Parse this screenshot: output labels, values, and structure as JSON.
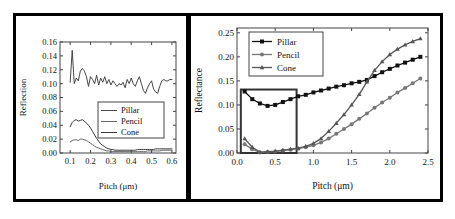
{
  "figure": {
    "left_panel_name": "inset-detail-panel",
    "right_panel_name": "main-plot-panel",
    "connector_name": "zoom-callout-connector"
  },
  "chart_data": [
    {
      "id": "inset",
      "type": "line",
      "title": "",
      "xlabel": "Pitch (μm)",
      "ylabel": "Reflection",
      "xlim": [
        0.05,
        0.62
      ],
      "ylim": [
        0.0,
        0.16
      ],
      "xticks": [
        0.1,
        0.2,
        0.3,
        0.4,
        0.5,
        0.6
      ],
      "xticklabels": [
        "0.1",
        "0.2",
        "0.3",
        "0.4",
        "0.5",
        "0.6"
      ],
      "yticks": [
        0.0,
        0.02,
        0.04,
        0.06,
        0.08,
        0.1,
        0.12,
        0.14,
        0.16
      ],
      "yticklabels": [
        "0.00",
        "0.02",
        "0.04",
        "0.06",
        "0.08",
        "0.10",
        "0.12",
        "0.14",
        "0.16"
      ],
      "grid": false,
      "legend_position": "center-right",
      "legend_entries": [
        "Pillar",
        "Pencil",
        "Cone"
      ],
      "x": [
        0.1,
        0.11,
        0.12,
        0.13,
        0.14,
        0.15,
        0.16,
        0.17,
        0.18,
        0.19,
        0.2,
        0.21,
        0.22,
        0.23,
        0.24,
        0.25,
        0.26,
        0.27,
        0.28,
        0.29,
        0.3,
        0.31,
        0.32,
        0.33,
        0.34,
        0.35,
        0.36,
        0.37,
        0.38,
        0.39,
        0.4,
        0.41,
        0.42,
        0.43,
        0.44,
        0.45,
        0.46,
        0.47,
        0.48,
        0.49,
        0.5,
        0.51,
        0.52,
        0.53,
        0.54,
        0.55,
        0.56,
        0.57,
        0.58,
        0.59,
        0.6
      ],
      "series": [
        {
          "name": "Pillar",
          "color": "#333333",
          "values": [
            0.102,
            0.148,
            0.1,
            0.108,
            0.104,
            0.118,
            0.122,
            0.118,
            0.11,
            0.096,
            0.11,
            0.106,
            0.1,
            0.112,
            0.098,
            0.108,
            0.102,
            0.11,
            0.1,
            0.106,
            0.098,
            0.104,
            0.1,
            0.096,
            0.1,
            0.098,
            0.102,
            0.094,
            0.106,
            0.1,
            0.108,
            0.1,
            0.096,
            0.104,
            0.11,
            0.1,
            0.09,
            0.086,
            0.094,
            0.1,
            0.104,
            0.092,
            0.088,
            0.086,
            0.096,
            0.104,
            0.106,
            0.104,
            0.104,
            0.106,
            0.106
          ]
        },
        {
          "name": "Pencil",
          "color": "#555555",
          "values": [
            0.016,
            0.018,
            0.019,
            0.019,
            0.018,
            0.02,
            0.02,
            0.019,
            0.018,
            0.016,
            0.014,
            0.012,
            0.01,
            0.008,
            0.007,
            0.006,
            0.005,
            0.004,
            0.003,
            0.003,
            0.002,
            0.002,
            0.002,
            0.002,
            0.002,
            0.002,
            0.002,
            0.002,
            0.002,
            0.002,
            0.002,
            0.002,
            0.002,
            0.002,
            0.002,
            0.002,
            0.002,
            0.002,
            0.003,
            0.003,
            0.003,
            0.003,
            0.003,
            0.003,
            0.003,
            0.004,
            0.004,
            0.004,
            0.004,
            0.004,
            0.004
          ]
        },
        {
          "name": "Cone",
          "color": "#222222",
          "values": [
            0.038,
            0.044,
            0.047,
            0.048,
            0.046,
            0.047,
            0.048,
            0.046,
            0.043,
            0.04,
            0.036,
            0.031,
            0.026,
            0.021,
            0.017,
            0.013,
            0.011,
            0.009,
            0.007,
            0.006,
            0.005,
            0.005,
            0.004,
            0.004,
            0.004,
            0.004,
            0.004,
            0.004,
            0.004,
            0.004,
            0.004,
            0.004,
            0.004,
            0.005,
            0.005,
            0.005,
            0.005,
            0.005,
            0.005,
            0.005,
            0.005,
            0.005,
            0.006,
            0.006,
            0.006,
            0.006,
            0.006,
            0.006,
            0.006,
            0.006,
            0.006
          ]
        }
      ]
    },
    {
      "id": "main",
      "type": "line",
      "title": "",
      "xlabel": "Pitch (μm)",
      "ylabel": "Reflectance",
      "xlim": [
        0.0,
        2.5
      ],
      "ylim": [
        0.0,
        0.26
      ],
      "xticks": [
        0.0,
        0.5,
        1.0,
        1.5,
        2.0,
        2.5
      ],
      "xticklabels": [
        "0.0",
        "0.5",
        "1.0",
        "1.5",
        "2.0",
        "2.5"
      ],
      "yticks": [
        0.0,
        0.05,
        0.1,
        0.15,
        0.2,
        0.25
      ],
      "yticklabels": [
        "0.00",
        "0.05",
        "0.10",
        "0.15",
        "0.20",
        "0.25"
      ],
      "grid": false,
      "legend_position": "top-left",
      "legend_entries": [
        "Pillar",
        "Pencil",
        "Cone"
      ],
      "highlight_box": {
        "x0": 0.05,
        "x1": 0.78,
        "y0": 0.0,
        "y1": 0.132,
        "color": "#333333"
      },
      "x": [
        0.1,
        0.2,
        0.3,
        0.4,
        0.5,
        0.6,
        0.7,
        0.8,
        0.9,
        1.0,
        1.1,
        1.2,
        1.3,
        1.4,
        1.5,
        1.6,
        1.7,
        1.8,
        1.9,
        2.0,
        2.1,
        2.2,
        2.3,
        2.4
      ],
      "series": [
        {
          "name": "Pillar",
          "color": "#111111",
          "marker": "square",
          "values": [
            0.128,
            0.112,
            0.103,
            0.098,
            0.1,
            0.106,
            0.112,
            0.118,
            0.121,
            0.126,
            0.13,
            0.134,
            0.138,
            0.141,
            0.145,
            0.148,
            0.152,
            0.16,
            0.168,
            0.175,
            0.182,
            0.188,
            0.194,
            0.2
          ]
        },
        {
          "name": "Pencil",
          "color": "#777777",
          "marker": "circle",
          "values": [
            0.018,
            0.008,
            0.001,
            0.002,
            0.003,
            0.005,
            0.007,
            0.009,
            0.012,
            0.016,
            0.022,
            0.03,
            0.04,
            0.05,
            0.06,
            0.071,
            0.082,
            0.094,
            0.105,
            0.115,
            0.126,
            0.135,
            0.145,
            0.155
          ]
        },
        {
          "name": "Cone",
          "color": "#555555",
          "marker": "triangle",
          "values": [
            0.03,
            0.012,
            0.002,
            0.003,
            0.004,
            0.006,
            0.008,
            0.01,
            0.014,
            0.02,
            0.03,
            0.045,
            0.062,
            0.08,
            0.1,
            0.122,
            0.148,
            0.172,
            0.19,
            0.205,
            0.216,
            0.225,
            0.232,
            0.238
          ]
        }
      ]
    }
  ]
}
